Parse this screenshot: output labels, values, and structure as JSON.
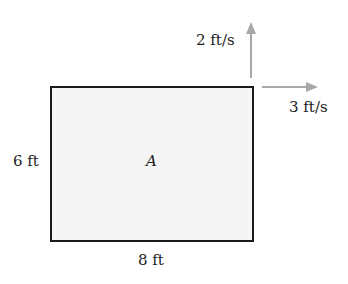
{
  "diagram": {
    "region_label": "A",
    "height_label": "6 ft",
    "width_label": "8 ft",
    "vertical_velocity_label": "2 ft/s",
    "horizontal_velocity_label": "3 ft/s",
    "colors": {
      "outline": "#1a1a1a",
      "fill": "#f5f5f5",
      "arrow": "#a8a8a8"
    }
  }
}
